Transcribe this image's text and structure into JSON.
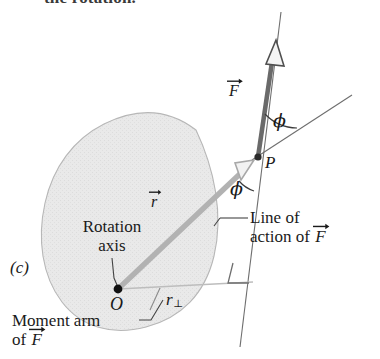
{
  "figure": {
    "panel_label": "(c)",
    "caption_fragment": "the rotation.",
    "topic": "torque-moment-arm-diagram",
    "colors": {
      "body_fill": "#e8e8e8",
      "body_outline": "#b4b4b4",
      "force_vector": "#5e5e5e",
      "r_vector": "#b0b0b0",
      "thin_line": "#6b6b6b",
      "text": "#1a1a1a",
      "point": "#111111"
    }
  },
  "labels": {
    "force_vector": "F",
    "r_vector": "r",
    "point_p": "P",
    "point_o": "O",
    "moment_arm_symbol": "r",
    "moment_arm_subscript": "⊥",
    "angle_upper": "ϕ",
    "angle_lower": "ϕ",
    "rotation_axis_line1": "Rotation",
    "rotation_axis_line2": "axis",
    "line_of_action_line1": "Line of",
    "line_of_action_line2_prefix": "action of",
    "moment_arm_line1": "Moment arm",
    "moment_arm_line2_prefix": "of"
  },
  "geometry": {
    "point_o": [
      118,
      289
    ],
    "point_p": [
      258,
      156
    ],
    "force_tail": [
      258,
      156
    ],
    "force_tip": [
      276,
      46
    ],
    "line_of_action_top": [
      281,
      14
    ],
    "line_of_action_bottom": [
      241,
      345
    ],
    "r_tail": [
      118,
      289
    ],
    "r_tip": [
      253,
      162
    ],
    "r_extended_tip": [
      350,
      97
    ],
    "moment_arm_start": [
      118,
      289
    ],
    "moment_arm_end": [
      252,
      282
    ],
    "right_angle_corner": [
      252,
      282
    ]
  }
}
